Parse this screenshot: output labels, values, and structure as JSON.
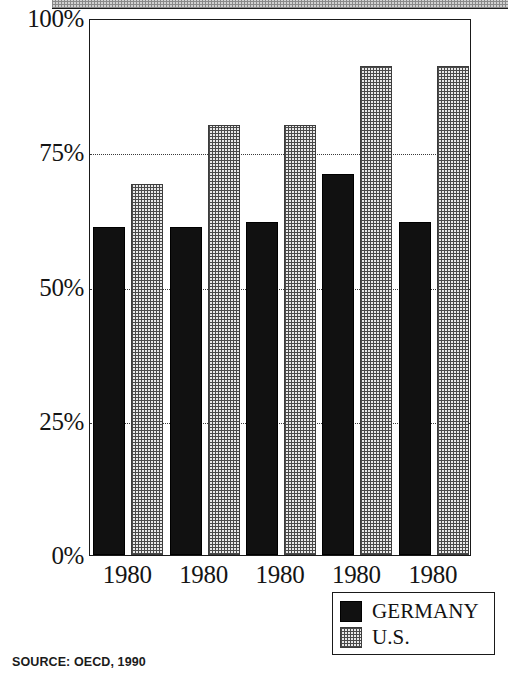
{
  "chart_data": {
    "type": "bar",
    "title": "",
    "subtitle": "",
    "xlabel": "",
    "ylabel": "",
    "categories": [
      "1980",
      "1980",
      "1980",
      "1980",
      "1980"
    ],
    "series": [
      {
        "name": "GERMANY",
        "color": "#111111",
        "values": [
          61,
          61,
          62,
          71,
          62
        ]
      },
      {
        "name": "U.S.",
        "color": "#e9e9e9",
        "values": [
          69,
          80,
          80,
          91,
          91
        ]
      }
    ],
    "ylim": [
      0,
      100
    ],
    "yticks": [
      0,
      25,
      50,
      75,
      100
    ],
    "ytick_labels": [
      "0%",
      "25%",
      "50%",
      "75%",
      "100%"
    ],
    "grid": true,
    "gridlines_at": [
      25,
      50,
      75
    ],
    "legend_position": "bottom-right",
    "annotations": [
      "SOURCE: OECD, 1990"
    ]
  },
  "axis": {
    "y_labels": [
      "100%",
      "75%",
      "50%",
      "25%",
      "0%"
    ],
    "x_labels": [
      "1980",
      "1980",
      "1980",
      "1980",
      "1980"
    ]
  },
  "legend": {
    "items": [
      {
        "label": "GERMANY",
        "swatch": "solid-black-swatch"
      },
      {
        "label": "U.S.",
        "swatch": "dotted-grey-swatch"
      }
    ]
  },
  "source": {
    "text": "SOURCE: OECD, 1990"
  }
}
